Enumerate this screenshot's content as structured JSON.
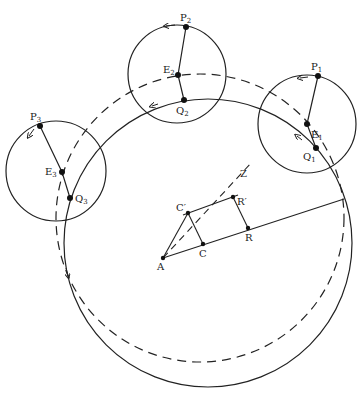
{
  "diagram": {
    "type": "geometric-epicycle-diagram",
    "deferent_solid": {
      "cx": 208,
      "cy": 243,
      "r": 144,
      "style": "solid"
    },
    "deferent_dashed": {
      "cx": 200,
      "cy": 218,
      "r": 144,
      "style": "dashed"
    },
    "epicycles": [
      {
        "id": "1",
        "cx": 307,
        "cy": 124,
        "r": 49,
        "P": {
          "label": "P",
          "sub": "1",
          "x": 318,
          "y": 76
        },
        "E": {
          "label": "E",
          "sub": "1",
          "x": 307,
          "y": 124
        },
        "Q": {
          "label": "Q",
          "sub": "1",
          "x": 316,
          "y": 148
        }
      },
      {
        "id": "2",
        "cx": 177,
        "cy": 74,
        "r": 49,
        "P": {
          "label": "P",
          "sub": "2",
          "x": 186,
          "y": 27
        },
        "E": {
          "label": "E",
          "sub": "2",
          "x": 178,
          "y": 75
        },
        "Q": {
          "label": "Q",
          "sub": "2",
          "x": 184,
          "y": 100
        }
      },
      {
        "id": "3",
        "cx": 56,
        "cy": 171,
        "r": 50,
        "P": {
          "label": "P",
          "sub": "3",
          "x": 40,
          "y": 126
        },
        "E": {
          "label": "E",
          "sub": "3",
          "x": 62,
          "y": 172
        },
        "Q": {
          "label": "Q",
          "sub": "3",
          "x": 70,
          "y": 198
        }
      }
    ],
    "points": {
      "A": {
        "label": "A",
        "x": 163,
        "y": 258
      },
      "C": {
        "label": "C",
        "x": 203,
        "y": 244
      },
      "R": {
        "label": "R",
        "x": 248,
        "y": 228
      },
      "C_prime": {
        "label": "C′",
        "x": 188,
        "y": 213
      },
      "R_prime": {
        "label": "R′",
        "x": 233,
        "y": 197
      },
      "Z": {
        "label": "Z",
        "x": 245,
        "y": 168
      }
    },
    "labels": {
      "A": "A",
      "C": "C",
      "R": "R",
      "C_prime": "C′",
      "R_prime": "R′",
      "Z": "Z",
      "P": "P",
      "E": "E",
      "Q": "Q",
      "s1": "1",
      "s2": "2",
      "s3": "3"
    }
  }
}
